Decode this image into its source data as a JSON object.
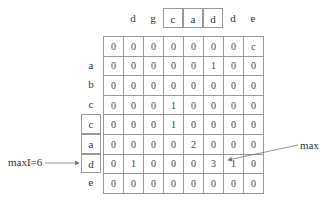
{
  "diagram": {
    "column_headers": [
      "d",
      "g",
      "c",
      "a",
      "d",
      "d",
      "e"
    ],
    "boxed_column_headers": [
      2,
      3,
      4
    ],
    "row_labels": [
      "",
      "a",
      "b",
      "c",
      "c",
      "a",
      "d",
      "e"
    ],
    "boxed_row_labels": [
      4,
      5,
      6
    ],
    "matrix": [
      [
        "0",
        "0",
        "0",
        "0",
        "0",
        "0",
        "0",
        "c"
      ],
      [
        "0",
        "0",
        "0",
        "0",
        "0",
        "1",
        "0",
        "0"
      ],
      [
        "0",
        "0",
        "0",
        "0",
        "0",
        "0",
        "0",
        "0"
      ],
      [
        "0",
        "0",
        "0",
        "1",
        "0",
        "0",
        "0",
        "0"
      ],
      [
        "0",
        "0",
        "0",
        "1",
        "0",
        "0",
        "0",
        "0"
      ],
      [
        "0",
        "0",
        "0",
        "0",
        "2",
        "0",
        "0",
        "0"
      ],
      [
        "0",
        "1",
        "0",
        "0",
        "0",
        "3",
        "1",
        "0"
      ],
      [
        "0",
        "0",
        "0",
        "0",
        "0",
        "0",
        "0",
        "0"
      ]
    ],
    "annotations": {
      "maxI_label": "maxI=6",
      "max_label": "max"
    },
    "colors": {
      "line": "#999999",
      "text": "#333333",
      "arrow": "#777777"
    }
  }
}
